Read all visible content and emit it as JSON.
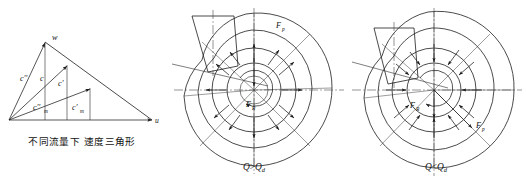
{
  "figure": {
    "panels": [
      {
        "id": "velocity-triangle",
        "caption": "不同流量下 速度三角形",
        "axis_labels": {
          "u": "u",
          "w": "w"
        },
        "vector_labels": [
          "c''",
          "c",
          "c'"
        ],
        "meridional_labels": [
          "c''",
          "c'"
        ],
        "meridional_subscript": "m",
        "vector_subscript": "m"
      },
      {
        "id": "high-flow",
        "caption_main": "Q",
        "caption_rel": ">",
        "caption_ref": "Q",
        "caption_ref_sub": "d",
        "caption_full": "Q>Q d",
        "force_labels": [
          {
            "symbol": "F",
            "sub": "p"
          },
          {
            "symbol": "F",
            "sub": "R"
          }
        ],
        "arrow_direction": "outward"
      },
      {
        "id": "low-flow",
        "caption_main": "Q",
        "caption_rel": "<",
        "caption_ref": "Q",
        "caption_ref_sub": "d",
        "caption_full": "Q<Q d",
        "force_labels": [
          {
            "symbol": "F",
            "sub": "R"
          },
          {
            "symbol": "F",
            "sub": "p"
          }
        ],
        "arrow_direction": "inward"
      }
    ],
    "colors": {
      "line": "#1d1d1d",
      "background": "#ffffff",
      "text": "#111111"
    }
  }
}
